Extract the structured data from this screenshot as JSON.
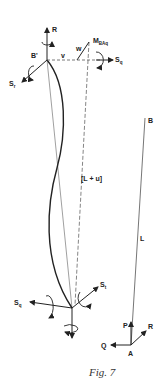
{
  "figure": {
    "caption": "Fig. 7",
    "colors": {
      "ink": "#222222",
      "thin_line": "#777777",
      "background": "#ffffff"
    }
  },
  "deformed_element": {
    "top_node": {
      "label": "B'",
      "x": 47,
      "y": 60
    },
    "bottom_node": {
      "x": 72,
      "y": 308
    },
    "labels": {
      "R": "R",
      "B_prime": "B'",
      "S_r": "S",
      "S_r_sub": "r",
      "v": "v",
      "w": "w",
      "M": "M",
      "M_sub": "BAq",
      "S_q_top": "S",
      "S_q_top_sub": "q",
      "length": "[L + u]",
      "S_q_bottom": "S",
      "S_q_bottom_sub": "q",
      "S_t": "S",
      "S_t_sub": "t"
    }
  },
  "reference_element": {
    "labels": {
      "B": "B",
      "L": "L",
      "P": "P",
      "R": "R",
      "Q": "Q",
      "A": "A"
    }
  }
}
